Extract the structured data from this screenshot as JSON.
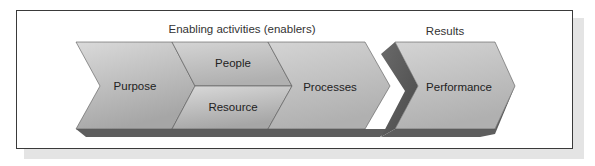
{
  "headers": {
    "enablers": "Enabling activities (enablers)",
    "results": "Results"
  },
  "blocks": [
    {
      "id": "purpose",
      "label": "Purpose"
    },
    {
      "id": "people",
      "label": "People"
    },
    {
      "id": "resource",
      "label": "Resource"
    },
    {
      "id": "processes",
      "label": "Processes"
    },
    {
      "id": "performance",
      "label": "Performance"
    }
  ],
  "colors": {
    "face_light": "#d6d6d6",
    "face_dark": "#a9a9a9",
    "side_dark": "#5a5a5a",
    "bottom_strip": "#6b6b6b",
    "frame_border": "#3a3a3a",
    "shadow": "#e4e4e4"
  }
}
